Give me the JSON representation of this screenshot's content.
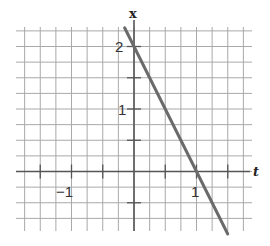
{
  "chart_data": {
    "type": "line",
    "title": "",
    "xlabel": "t",
    "ylabel": "x",
    "xlim": [
      -1.9,
      1.9
    ],
    "ylim": [
      -0.95,
      2.25
    ],
    "grid": true,
    "grid_step": 0.25,
    "x_tick_labels": [
      {
        "value": -1,
        "label": "−1"
      },
      {
        "value": 1,
        "label": "1"
      }
    ],
    "y_tick_labels": [
      {
        "value": 1,
        "label": "1"
      },
      {
        "value": 2,
        "label": "2"
      }
    ],
    "series": [
      {
        "name": "x = 2 − 2t",
        "x": [
          -0.15,
          0,
          0.5,
          1,
          1.5
        ],
        "y": [
          2.3,
          2,
          1,
          0,
          -1
        ],
        "color": "#6a6a6a"
      }
    ]
  },
  "labels": {
    "x_axis": "t",
    "y_axis": "x",
    "tick_neg1": "−1",
    "tick_t1": "1",
    "tick_x1": "1",
    "tick_x2": "2"
  },
  "colors": {
    "grid": "#a9a9a9",
    "axis": "#555555",
    "line": "#6a6a6a"
  }
}
